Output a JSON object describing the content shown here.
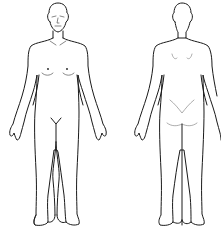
{
  "diagram": {
    "type": "body-outline-chart",
    "views": [
      {
        "id": "front",
        "label": "Front view (anterior)"
      },
      {
        "id": "back",
        "label": "Back view (posterior)"
      }
    ],
    "colors": {
      "line": "#1a1a1a",
      "detail": "#555555",
      "background": "#ffffff"
    }
  }
}
